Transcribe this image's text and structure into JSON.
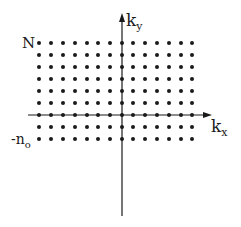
{
  "diagram": {
    "title": "",
    "axes": {
      "x_label_main": "k",
      "x_label_sub": "x",
      "y_label_main": "k",
      "y_label_sub": "y"
    },
    "lattice": {
      "columns": 14,
      "rows": 9,
      "top_label": "N",
      "bottom_label_main": "-n",
      "bottom_label_sub": "o",
      "x_positions": [
        39,
        51,
        63,
        75,
        87,
        98,
        110,
        122,
        133,
        145,
        157,
        169,
        181,
        192
      ],
      "y_positions": [
        43,
        55,
        67,
        79,
        91,
        103,
        115,
        127,
        139
      ]
    },
    "colors": {
      "ink": "#1a1a1a",
      "background": "#ffffff"
    }
  }
}
